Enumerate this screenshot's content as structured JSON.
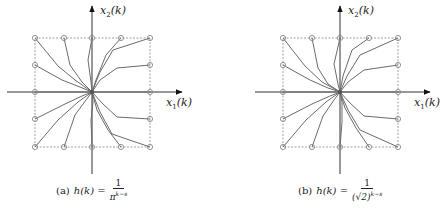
{
  "figure": {
    "colors": {
      "trajectory": "#6b6b6b",
      "axis": "#333333",
      "box": "#8a8a8a",
      "marker": "#8a8a8a"
    },
    "panels": [
      {
        "id": "a",
        "offset_x": 0,
        "center": [
          92,
          92
        ],
        "box": {
          "x1": 35,
          "y1": 38,
          "x2": 150,
          "y2": 147
        },
        "h_axis": {
          "x_start": 7,
          "x_end": 182,
          "y": 92
        },
        "v_axis": {
          "y_start": 6,
          "y_end": 174,
          "x": 92
        },
        "y_axis_label": {
          "var": "x",
          "sub": "2",
          "arg": "(k)"
        },
        "x_axis_label": {
          "var": "x",
          "sub": "1",
          "arg": "(k)"
        },
        "caption": {
          "tag": "(a)",
          "lhs": "h(k) =",
          "numerator": "1",
          "denominator_base": "π",
          "denominator_exp": "k−s"
        },
        "markers": [
          [
            35,
            38
          ],
          [
            64,
            38
          ],
          [
            92,
            38
          ],
          [
            121,
            38
          ],
          [
            150,
            38
          ],
          [
            35,
            65
          ],
          [
            150,
            65
          ],
          [
            35,
            92
          ],
          [
            150,
            92
          ],
          [
            35,
            119
          ],
          [
            150,
            119
          ],
          [
            35,
            147
          ],
          [
            64,
            147
          ],
          [
            92,
            147
          ],
          [
            121,
            147
          ],
          [
            150,
            147
          ]
        ],
        "trajectories": [
          [
            [
              35,
              38
            ],
            [
              58,
              66
            ],
            [
              75,
              80
            ],
            [
              92,
              92
            ]
          ],
          [
            [
              64,
              38
            ],
            [
              70,
              65
            ],
            [
              82,
              82
            ],
            [
              92,
              92
            ]
          ],
          [
            [
              92,
              38
            ],
            [
              88,
              60
            ],
            [
              91,
              82
            ],
            [
              92,
              92
            ]
          ],
          [
            [
              121,
              38
            ],
            [
              106,
              55
            ],
            [
              96,
              80
            ],
            [
              92,
              92
            ]
          ],
          [
            [
              150,
              38
            ],
            [
              113,
              50
            ],
            [
              100,
              72
            ],
            [
              92,
              92
            ]
          ],
          [
            [
              150,
              65
            ],
            [
              117,
              68
            ],
            [
              100,
              80
            ],
            [
              92,
              92
            ]
          ],
          [
            [
              35,
              65
            ],
            [
              62,
              80
            ],
            [
              80,
              87
            ],
            [
              92,
              92
            ]
          ],
          [
            [
              35,
              92
            ],
            [
              92,
              92
            ]
          ],
          [
            [
              150,
              92
            ],
            [
              92,
              92
            ]
          ],
          [
            [
              35,
              119
            ],
            [
              65,
              104
            ],
            [
              82,
              96
            ],
            [
              92,
              92
            ]
          ],
          [
            [
              35,
              147
            ],
            [
              58,
              120
            ],
            [
              78,
              102
            ],
            [
              92,
              92
            ]
          ],
          [
            [
              64,
              147
            ],
            [
              75,
              115
            ],
            [
              86,
              100
            ],
            [
              92,
              92
            ]
          ],
          [
            [
              92,
              147
            ],
            [
              91,
              120
            ],
            [
              93,
              102
            ],
            [
              92,
              92
            ]
          ],
          [
            [
              121,
              147
            ],
            [
              108,
              130
            ],
            [
              97,
              110
            ],
            [
              92,
              92
            ]
          ],
          [
            [
              150,
              147
            ],
            [
              112,
              134
            ],
            [
              100,
              112
            ],
            [
              92,
              92
            ]
          ],
          [
            [
              150,
              119
            ],
            [
              117,
              117
            ],
            [
              103,
              104
            ],
            [
              92,
              92
            ]
          ]
        ]
      },
      {
        "id": "b",
        "offset_x": 0,
        "center": [
          340,
          92
        ],
        "box": {
          "x1": 283,
          "y1": 38,
          "x2": 398,
          "y2": 147
        },
        "h_axis": {
          "x_start": 255,
          "x_end": 430,
          "y": 92
        },
        "v_axis": {
          "y_start": 6,
          "y_end": 174,
          "x": 340
        },
        "y_axis_label": {
          "var": "x",
          "sub": "2",
          "arg": "(k)"
        },
        "x_axis_label": {
          "var": "x",
          "sub": "1",
          "arg": "(k)"
        },
        "caption": {
          "tag": "(b)",
          "lhs": "h(k) =",
          "numerator": "1",
          "denominator_base": "(√2)",
          "denominator_exp": "k−s"
        },
        "markers": [
          [
            283,
            38
          ],
          [
            312,
            38
          ],
          [
            340,
            38
          ],
          [
            369,
            38
          ],
          [
            398,
            38
          ],
          [
            283,
            65
          ],
          [
            398,
            65
          ],
          [
            283,
            92
          ],
          [
            398,
            92
          ],
          [
            283,
            119
          ],
          [
            398,
            119
          ],
          [
            283,
            147
          ],
          [
            312,
            147
          ],
          [
            340,
            147
          ],
          [
            369,
            147
          ],
          [
            398,
            147
          ]
        ],
        "trajectories": [
          [
            [
              283,
              38
            ],
            [
              305,
              66
            ],
            [
              322,
              82
            ],
            [
              340,
              92
            ]
          ],
          [
            [
              312,
              38
            ],
            [
              318,
              68
            ],
            [
              328,
              84
            ],
            [
              340,
              92
            ]
          ],
          [
            [
              340,
              38
            ],
            [
              334,
              64
            ],
            [
              338,
              84
            ],
            [
              340,
              92
            ]
          ],
          [
            [
              369,
              38
            ],
            [
              352,
              50
            ],
            [
              343,
              76
            ],
            [
              340,
              92
            ]
          ],
          [
            [
              398,
              38
            ],
            [
              360,
              55
            ],
            [
              347,
              76
            ],
            [
              340,
              92
            ]
          ],
          [
            [
              398,
              65
            ],
            [
              364,
              70
            ],
            [
              348,
              82
            ],
            [
              340,
              92
            ]
          ],
          [
            [
              283,
              65
            ],
            [
              310,
              80
            ],
            [
              328,
              88
            ],
            [
              340,
              92
            ]
          ],
          [
            [
              283,
              92
            ],
            [
              340,
              92
            ]
          ],
          [
            [
              398,
              92
            ],
            [
              340,
              92
            ]
          ],
          [
            [
              283,
              119
            ],
            [
              312,
              104
            ],
            [
              330,
              96
            ],
            [
              340,
              92
            ]
          ],
          [
            [
              283,
              147
            ],
            [
              306,
              120
            ],
            [
              326,
              102
            ],
            [
              340,
              92
            ]
          ],
          [
            [
              312,
              147
            ],
            [
              323,
              116
            ],
            [
              334,
              100
            ],
            [
              340,
              92
            ]
          ],
          [
            [
              340,
              147
            ],
            [
              342,
              122
            ],
            [
              342,
              102
            ],
            [
              340,
              92
            ]
          ],
          [
            [
              369,
              147
            ],
            [
              356,
              128
            ],
            [
              345,
              108
            ],
            [
              340,
              92
            ]
          ],
          [
            [
              398,
              147
            ],
            [
              360,
              130
            ],
            [
              348,
              110
            ],
            [
              340,
              92
            ]
          ],
          [
            [
              398,
              119
            ],
            [
              364,
              116
            ],
            [
              350,
              103
            ],
            [
              340,
              92
            ]
          ]
        ]
      }
    ]
  }
}
